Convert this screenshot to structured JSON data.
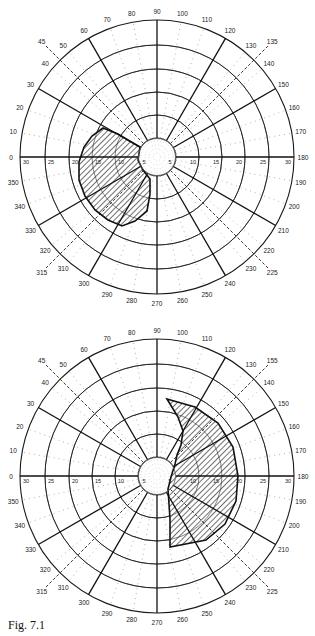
{
  "figure": {
    "caption": "Fig. 7.1"
  },
  "chart_data": [
    {
      "type": "polar-perimetry",
      "title": "",
      "position": "top",
      "center_px": [
        157,
        157
      ],
      "ring_radius_px": {
        "5": 19,
        "10": 42,
        "15": 65,
        "20": 88,
        "25": 112,
        "30": 137
      },
      "eccentricity_rings": [
        5,
        10,
        15,
        20,
        25,
        30
      ],
      "eccentricity_labels_left": [
        "30",
        "25",
        "20",
        "15",
        "10",
        "5"
      ],
      "eccentricity_labels_right": [
        "5",
        "10",
        "15",
        "20",
        "25",
        "30"
      ],
      "meridian_labels": [
        "0",
        "10",
        "20",
        "30",
        "40",
        "50",
        "60",
        "70",
        "80",
        "90",
        "100",
        "110",
        "120",
        "130",
        "140",
        "150",
        "160",
        "170",
        "180",
        "190",
        "200",
        "210",
        "220",
        "230",
        "240",
        "250",
        "260",
        "270",
        "280",
        "290",
        "300",
        "310",
        "320",
        "330",
        "340",
        "350"
      ],
      "solid_meridians": [
        0,
        30,
        60,
        90,
        120,
        150
      ],
      "dashed_meridians": [
        45,
        135
      ],
      "dashed_labels": [
        "45",
        "135",
        "225",
        "315"
      ],
      "angle_convention": "0 at left, 90 at top, 180 at right, 270 at bottom",
      "hatched_region": {
        "description": "Scotoma / defect region on left side of field",
        "angle_span_deg": [
          25,
          300
        ],
        "outline_px": [
          [
            103,
            128
          ],
          [
            118,
            134
          ],
          [
            128,
            140
          ],
          [
            140,
            147
          ],
          [
            138,
            160
          ],
          [
            143,
            170
          ],
          [
            150,
            179
          ],
          [
            150,
            194
          ],
          [
            147,
            211
          ],
          [
            135,
            221
          ],
          [
            122,
            226
          ],
          [
            108,
            220
          ],
          [
            95,
            210
          ],
          [
            85,
            196
          ],
          [
            79,
            180
          ],
          [
            79,
            162
          ],
          [
            84,
            147
          ],
          [
            92,
            136
          ]
        ]
      }
    },
    {
      "type": "polar-perimetry",
      "title": "",
      "position": "bottom",
      "center_px": [
        157,
        157
      ],
      "ring_radius_px": {
        "5": 19,
        "10": 42,
        "15": 65,
        "20": 88,
        "25": 112,
        "30": 137
      },
      "eccentricity_rings": [
        5,
        10,
        15,
        20,
        25,
        30
      ],
      "eccentricity_labels_left": [
        "30",
        "25",
        "20",
        "15",
        "10",
        "5"
      ],
      "eccentricity_labels_right": [
        "5",
        "10",
        "15",
        "20",
        "25",
        "30"
      ],
      "meridian_labels": [
        "0",
        "10",
        "20",
        "30",
        "40",
        "50",
        "60",
        "70",
        "80",
        "90",
        "100",
        "110",
        "120",
        "130",
        "140",
        "150",
        "160",
        "170",
        "180",
        "190",
        "200",
        "210",
        "220",
        "230",
        "240",
        "250",
        "260",
        "270",
        "280",
        "290",
        "300",
        "310",
        "320",
        "330",
        "340",
        "350"
      ],
      "solid_meridians": [
        0,
        30,
        60,
        90,
        120,
        150
      ],
      "dashed_meridians": [
        45,
        135
      ],
      "dashed_labels": [
        "45",
        "155",
        "225",
        "315"
      ],
      "angle_convention": "0 at left, 90 at top, 180 at right, 270 at bottom",
      "hatched_region": {
        "description": "Hemianopic defect region on right side of field",
        "angle_span_deg": [
          95,
          275
        ],
        "outline_px": [
          [
            167,
            80
          ],
          [
            195,
            88
          ],
          [
            218,
            104
          ],
          [
            233,
            128
          ],
          [
            238,
            157
          ],
          [
            236,
            182
          ],
          [
            225,
            205
          ],
          [
            206,
            221
          ],
          [
            170,
            228
          ],
          [
            170,
            200
          ],
          [
            168,
            170
          ],
          [
            171,
            158
          ],
          [
            175,
            145
          ],
          [
            177,
            136
          ],
          [
            181,
            126
          ],
          [
            183,
            112
          ],
          [
            178,
            98
          ]
        ]
      }
    }
  ]
}
